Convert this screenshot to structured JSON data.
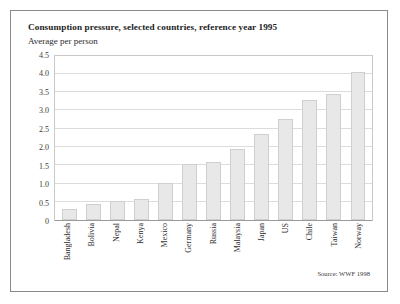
{
  "chart_data": {
    "type": "bar",
    "title": "Consumption pressure, selected countries, reference year 1995",
    "subtitle": "Average per person",
    "xlabel": "",
    "ylabel": "",
    "ylim": [
      0,
      4.5
    ],
    "ytick_labels": [
      "4.5",
      "4.0",
      "3.5",
      "3.0",
      "2.5",
      "2.0",
      "1.5",
      "1.0",
      "0.5",
      "0"
    ],
    "ytick_values": [
      4.5,
      4.0,
      3.5,
      3.0,
      2.5,
      2.0,
      1.5,
      1.0,
      0.5,
      0
    ],
    "grid": true,
    "legend": "none",
    "categories": [
      "Bangladesh",
      "Bolivia",
      "Nepal",
      "Kenya",
      "Mexico",
      "Germany",
      "Russia",
      "Malaysia",
      "Japan",
      "US",
      "Chile",
      "Taiwan",
      "Norway"
    ],
    "values": [
      0.3,
      0.45,
      0.52,
      0.57,
      1.0,
      1.52,
      1.57,
      1.95,
      2.35,
      2.75,
      3.28,
      3.43,
      4.03
    ],
    "bar_color": "#e8e8e8",
    "bar_edge_color": "#cfcfcf",
    "annotation": "Source: WWF 1998"
  }
}
